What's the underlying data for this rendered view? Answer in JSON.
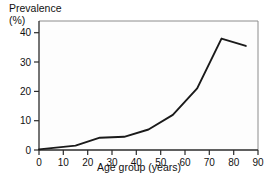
{
  "chart_data": {
    "type": "line",
    "title": "",
    "xlabel": "Age group (years)",
    "ylabel": "Prevalence (%)",
    "ylabel_lines": [
      "Prevalence",
      "(%)"
    ],
    "xlim": [
      0,
      90
    ],
    "ylim": [
      0,
      44
    ],
    "xticks": [
      0,
      10,
      20,
      30,
      40,
      50,
      60,
      70,
      80,
      90
    ],
    "xtick_labels": [
      "0",
      "10",
      "20",
      "30",
      "40",
      "50",
      "60",
      "70",
      "80",
      "90"
    ],
    "yticks": [
      0,
      10,
      20,
      30,
      40
    ],
    "ytick_labels": [
      "0",
      "10",
      "20",
      "30",
      "40"
    ],
    "grid": false,
    "legend": null,
    "series": [
      {
        "name": "Prevalence",
        "color": "#1a1a1a",
        "x": [
          0,
          15,
          25,
          35,
          45,
          55,
          65,
          75,
          85
        ],
        "values": [
          0.2,
          1.5,
          4.2,
          4.5,
          7.0,
          12.0,
          21.0,
          38.0,
          35.5
        ]
      }
    ]
  },
  "figure": {
    "background_color": "#ffffff",
    "plot_background_color": "#fdfdfd",
    "frame_color": "#555555",
    "line_color": "#1a1a1a"
  }
}
